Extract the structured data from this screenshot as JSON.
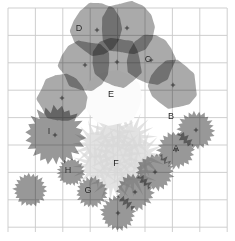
{
  "figure": {
    "background_color": "#ffffff",
    "grid": {
      "visible": true,
      "color": "#c9c9c9",
      "x_start": 8,
      "y_start": 8,
      "x_end": 227,
      "y_end": 232,
      "spacing": 27.4,
      "columns": 8,
      "rows": 8
    },
    "palette": {
      "canopy_gray": "#9c9c9c",
      "canopy_overlap_dark": "#6c6c6c",
      "shrub_gray": "#8d8d8d",
      "shrub_light": "#d8d8d8",
      "highlight_white": "#fbfbfb",
      "center_marker": "#2a2a2a",
      "label_color": "#1d1d1d"
    }
  },
  "chart_data": {
    "type": "scatter",
    "xlabel": "",
    "ylabel": "",
    "xlim": [
      8,
      227
    ],
    "ylim": [
      8,
      232
    ],
    "grid": true,
    "legend": "none",
    "series": [
      {
        "name": "Tree crowns",
        "shape": "blob",
        "fill": "#9c9c9c",
        "points": [
          {
            "label": "D",
            "cx": 97,
            "cy": 30,
            "r": 26,
            "label_x": 79,
            "label_y": 28,
            "marker": true
          },
          {
            "label": "",
            "cx": 127,
            "cy": 28,
            "r": 26,
            "label_x": 0,
            "label_y": 0,
            "marker": true
          },
          {
            "label": "",
            "cx": 85,
            "cy": 65,
            "r": 25,
            "label_x": 0,
            "label_y": 0,
            "marker": true
          },
          {
            "label": "",
            "cx": 117,
            "cy": 62,
            "r": 25,
            "label_x": 0,
            "label_y": 0,
            "marker": true
          },
          {
            "label": "C",
            "cx": 151,
            "cy": 60,
            "r": 24,
            "label_x": 148,
            "label_y": 59,
            "marker": true
          },
          {
            "label": "B",
            "cx": 173,
            "cy": 85,
            "r": 24,
            "label_x": 171,
            "label_y": 116,
            "marker": true
          },
          {
            "label": "",
            "cx": 62,
            "cy": 98,
            "r": 24,
            "label_x": 0,
            "label_y": 0,
            "marker": true
          }
        ]
      },
      {
        "name": "Shrubs spiky",
        "shape": "star",
        "fill": "#8d8d8d",
        "points": [
          {
            "label": "I",
            "cx": 55,
            "cy": 135,
            "r": 30,
            "label_x": 49,
            "label_y": 131,
            "marker": true
          },
          {
            "label": "H",
            "cx": 71,
            "cy": 172,
            "r": 14,
            "label_x": 68,
            "label_y": 170,
            "marker": false
          },
          {
            "label": "G",
            "cx": 92,
            "cy": 192,
            "r": 16,
            "label_x": 88,
            "label_y": 190,
            "marker": false
          },
          {
            "label": "",
            "cx": 118,
            "cy": 213,
            "r": 18,
            "label_x": 0,
            "label_y": 0,
            "marker": true
          },
          {
            "label": "",
            "cx": 135,
            "cy": 192,
            "r": 19,
            "label_x": 0,
            "label_y": 0,
            "marker": true
          },
          {
            "label": "",
            "cx": 155,
            "cy": 172,
            "r": 19,
            "label_x": 0,
            "label_y": 0,
            "marker": true
          },
          {
            "label": "A",
            "cx": 176,
            "cy": 150,
            "r": 19,
            "label_x": 176,
            "label_y": 148,
            "marker": true
          },
          {
            "label": "",
            "cx": 196,
            "cy": 130,
            "r": 19,
            "label_x": 0,
            "label_y": 0,
            "marker": true
          },
          {
            "label": "",
            "cx": 30,
            "cy": 190,
            "r": 17,
            "label_x": 0,
            "label_y": 0,
            "marker": false
          }
        ]
      },
      {
        "name": "Light understory",
        "shape": "star-cluster",
        "fill": "#d8d8d8",
        "points": [
          {
            "label": "F",
            "cx": 117,
            "cy": 155,
            "r": 48,
            "label_x": 116,
            "label_y": 163,
            "marker": false
          }
        ]
      },
      {
        "name": "Canopy gap",
        "shape": "blob",
        "fill": "#fbfbfb",
        "points": [
          {
            "label": "E",
            "cx": 114,
            "cy": 97,
            "r": 28,
            "label_x": 111,
            "label_y": 94,
            "marker": false
          }
        ]
      }
    ],
    "labels": [
      "A",
      "B",
      "C",
      "D",
      "E",
      "F",
      "G",
      "H",
      "I"
    ]
  }
}
